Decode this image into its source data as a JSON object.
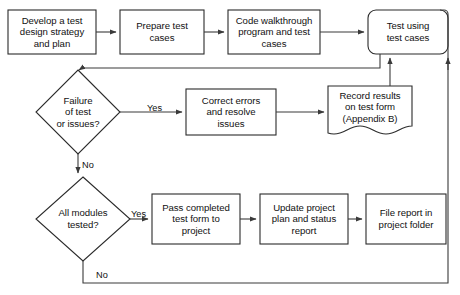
{
  "diagram": {
    "background": "#ffffff",
    "stroke_color": "#2b2b2b",
    "text_color": "#111111",
    "nodes": [
      {
        "id": "develop",
        "shape": "rectangle",
        "label": "Develop a test\ndesign strategy\nand plan",
        "x": 8,
        "y": 10,
        "w": 88,
        "h": 44
      },
      {
        "id": "prepare",
        "shape": "rectangle",
        "label": "Prepare test\ncases",
        "x": 120,
        "y": 10,
        "w": 84,
        "h": 44
      },
      {
        "id": "walkthrough",
        "shape": "rectangle",
        "label": "Code walkthrough\nprogram and test\ncases",
        "x": 228,
        "y": 10,
        "w": 92,
        "h": 44
      },
      {
        "id": "test-using",
        "shape": "rounded-rectangle",
        "label": "Test using\ntest cases",
        "x": 368,
        "y": 10,
        "w": 80,
        "h": 44
      },
      {
        "id": "failure-decision",
        "shape": "diamond",
        "label": "Failure\nof test\nor issues?",
        "x": 36,
        "y": 70,
        "w": 84,
        "h": 84
      },
      {
        "id": "correct-errors",
        "shape": "rectangle",
        "label": "Correct errors\nand resolve\nissues",
        "x": 186,
        "y": 89,
        "w": 90,
        "h": 46
      },
      {
        "id": "record-results",
        "shape": "document",
        "label": "Record results\non test form\n(Appendix B)",
        "x": 328,
        "y": 86,
        "w": 84,
        "h": 48
      },
      {
        "id": "modules-decision",
        "shape": "diamond",
        "label": "All modules\ntested?",
        "x": 36,
        "y": 177,
        "w": 94,
        "h": 84
      },
      {
        "id": "pass-completed",
        "shape": "rectangle",
        "label": "Pass completed\ntest form to\nproject",
        "x": 152,
        "y": 194,
        "w": 88,
        "h": 50
      },
      {
        "id": "update-project",
        "shape": "rectangle",
        "label": "Update project\nplan and status\nreport",
        "x": 260,
        "y": 194,
        "w": 88,
        "h": 50
      },
      {
        "id": "file-report",
        "shape": "rectangle",
        "label": "File report in\nproject folder",
        "x": 366,
        "y": 194,
        "w": 80,
        "h": 50
      }
    ],
    "edge_labels": [
      {
        "id": "failure-yes",
        "text": "Yes",
        "x": 147,
        "y": 103
      },
      {
        "id": "failure-no",
        "text": "No",
        "x": 82,
        "y": 160
      },
      {
        "id": "modules-yes",
        "text": "Yes",
        "x": 131,
        "y": 209
      },
      {
        "id": "modules-no",
        "text": "No",
        "x": 96,
        "y": 270
      }
    ],
    "edges": [
      {
        "id": "develop-to-prepare",
        "from": "develop",
        "to": "prepare"
      },
      {
        "id": "prepare-to-walkthrough",
        "from": "prepare",
        "to": "walkthrough"
      },
      {
        "id": "walkthrough-to-test-using",
        "from": "walkthrough",
        "to": "test-using"
      },
      {
        "id": "test-using-to-failure",
        "from": "test-using",
        "to": "failure-decision"
      },
      {
        "id": "failure-yes-to-correct",
        "from": "failure-decision",
        "to": "correct-errors",
        "label": "Yes"
      },
      {
        "id": "correct-to-record",
        "from": "correct-errors",
        "to": "record-results"
      },
      {
        "id": "record-to-test-using",
        "from": "record-results",
        "to": "test-using"
      },
      {
        "id": "failure-no-to-modules",
        "from": "failure-decision",
        "to": "modules-decision",
        "label": "No"
      },
      {
        "id": "modules-yes-to-pass",
        "from": "modules-decision",
        "to": "pass-completed",
        "label": "Yes"
      },
      {
        "id": "pass-to-update",
        "from": "pass-completed",
        "to": "update-project"
      },
      {
        "id": "update-to-file",
        "from": "update-project",
        "to": "file-report"
      },
      {
        "id": "modules-no-to-test-using",
        "from": "modules-decision",
        "to": "test-using",
        "label": "No"
      }
    ]
  }
}
